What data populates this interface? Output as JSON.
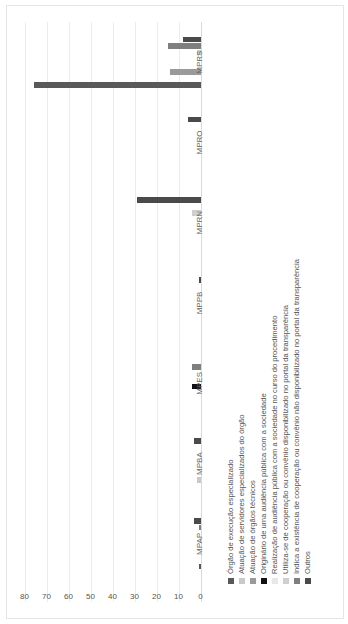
{
  "chart_data": {
    "type": "bar",
    "orientation": "vertical columns, image rotated 90° counter-clockwise",
    "title": "",
    "xlabel": "",
    "ylabel": "",
    "ylim": [
      0,
      80
    ],
    "yticks": [
      0,
      10,
      20,
      30,
      40,
      50,
      60,
      70,
      80
    ],
    "grid": true,
    "legend_position": "bottom",
    "categories": [
      "MPAP",
      "MPBA",
      "MPES",
      "MPPB",
      "MPRN",
      "MPRO",
      "MPRS"
    ],
    "series": [
      {
        "name": "Órgão de execução especializado",
        "color": "#595959",
        "values": [
          1,
          0,
          0,
          0,
          0,
          0,
          76
        ]
      },
      {
        "name": "Atuação de servidores especializados do órgão",
        "color": "#c9c9c9",
        "values": [
          0,
          2,
          0,
          0,
          0,
          0,
          0
        ]
      },
      {
        "name": "Atuação de órgãos técnicos",
        "color": "#9a9a9a",
        "values": [
          0,
          0,
          0,
          0,
          0,
          0,
          14
        ]
      },
      {
        "name": "Originário de uma audiência pública com a sociedade",
        "color": "#111111",
        "values": [
          0,
          0,
          4,
          0,
          0,
          0,
          0
        ]
      },
      {
        "name": "Realização de audiência pública com a sociedade no curso do procedimento",
        "color": "#e8e8e8",
        "values": [
          0.5,
          0,
          0,
          0,
          0,
          0.5,
          0
        ]
      },
      {
        "name": "Utiliza-se de cooperação ou convênio disponibilizado no portal da transparência",
        "color": "#cfcfcf",
        "values": [
          0,
          0,
          0,
          0,
          4,
          0,
          2
        ]
      },
      {
        "name": "Indica a existência de cooperação ou convênio não disponibilizado no portal da transparência",
        "color": "#7f7f7f",
        "values": [
          1,
          0,
          4,
          0,
          0,
          0,
          15
        ]
      },
      {
        "name": "Outros",
        "color": "#4a4a4a",
        "values": [
          3,
          3,
          0,
          1,
          29,
          6,
          8
        ]
      }
    ]
  }
}
